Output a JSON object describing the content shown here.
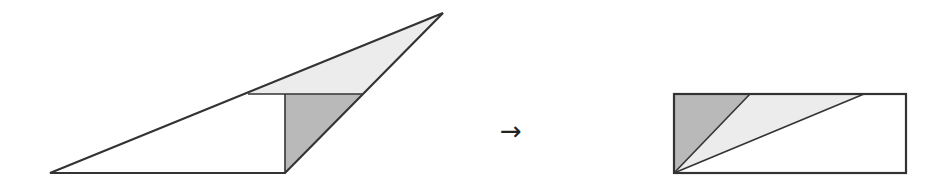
{
  "diagram": {
    "arrow_symbol": "→",
    "colors": {
      "stroke": "#333333",
      "dark_fill": "#b9b9b9",
      "light_fill": "#ececec",
      "white_fill": "#ffffff"
    },
    "left_figure": {
      "description": "obtuse triangle dissected into a white trapezoid, a dark triangle and a light triangle",
      "outer_triangle": [
        [
          50,
          173
        ],
        [
          443,
          13
        ],
        [
          285,
          173
        ]
      ],
      "light_triangle": [
        [
          248,
          94
        ],
        [
          443,
          13
        ],
        [
          362,
          94
        ]
      ],
      "dark_triangle": [
        [
          285,
          94
        ],
        [
          362,
          94
        ],
        [
          285,
          173
        ]
      ],
      "white_region": [
        [
          50,
          173
        ],
        [
          248,
          94
        ],
        [
          285,
          94
        ],
        [
          285,
          173
        ]
      ]
    },
    "right_figure": {
      "description": "rectangle formed by rearranged pieces",
      "rect": {
        "x": 674,
        "y": 94,
        "w": 232,
        "h": 79
      },
      "dark_triangle": [
        [
          674,
          94
        ],
        [
          750,
          94
        ],
        [
          674,
          173
        ]
      ],
      "light_triangle": [
        [
          750,
          94
        ],
        [
          864,
          94
        ],
        [
          674,
          173
        ]
      ],
      "white_region": [
        [
          864,
          94
        ],
        [
          906,
          94
        ],
        [
          906,
          173
        ],
        [
          674,
          173
        ]
      ]
    }
  }
}
